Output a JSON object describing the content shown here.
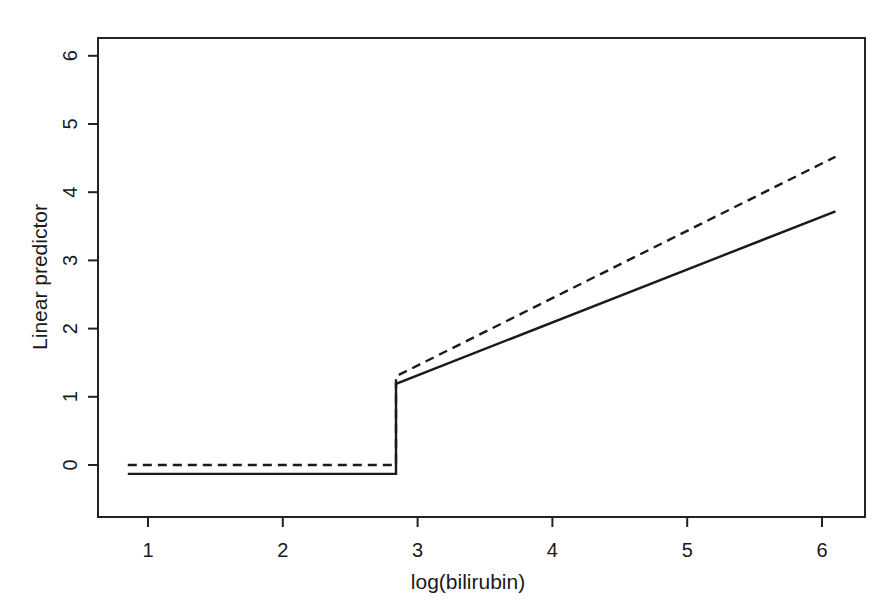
{
  "chart_data": {
    "type": "line",
    "title": "",
    "xlabel": "log(bilirubin)",
    "ylabel": "Linear predictor",
    "xlim": [
      0.63,
      6.33
    ],
    "ylim": [
      -0.76,
      6.27
    ],
    "x_ticks": [
      1,
      2,
      3,
      4,
      5,
      6
    ],
    "y_ticks": [
      0,
      1,
      2,
      3,
      4,
      5,
      6
    ],
    "x_tick_labels": [
      "1",
      "2",
      "3",
      "4",
      "5",
      "6"
    ],
    "y_tick_labels": [
      "0",
      "1",
      "2",
      "3",
      "4",
      "5",
      "6"
    ],
    "grid": false,
    "legend": null,
    "series": [
      {
        "name": "solid",
        "style": "solid",
        "points": [
          [
            0.85,
            -0.13
          ],
          [
            2.84,
            -0.13
          ],
          [
            2.84,
            1.19
          ],
          [
            6.1,
            3.72
          ]
        ]
      },
      {
        "name": "dashed",
        "style": "dashed",
        "points": [
          [
            0.85,
            0.0
          ],
          [
            2.84,
            0.0
          ],
          [
            2.84,
            1.3
          ],
          [
            6.1,
            4.52
          ]
        ]
      }
    ]
  }
}
